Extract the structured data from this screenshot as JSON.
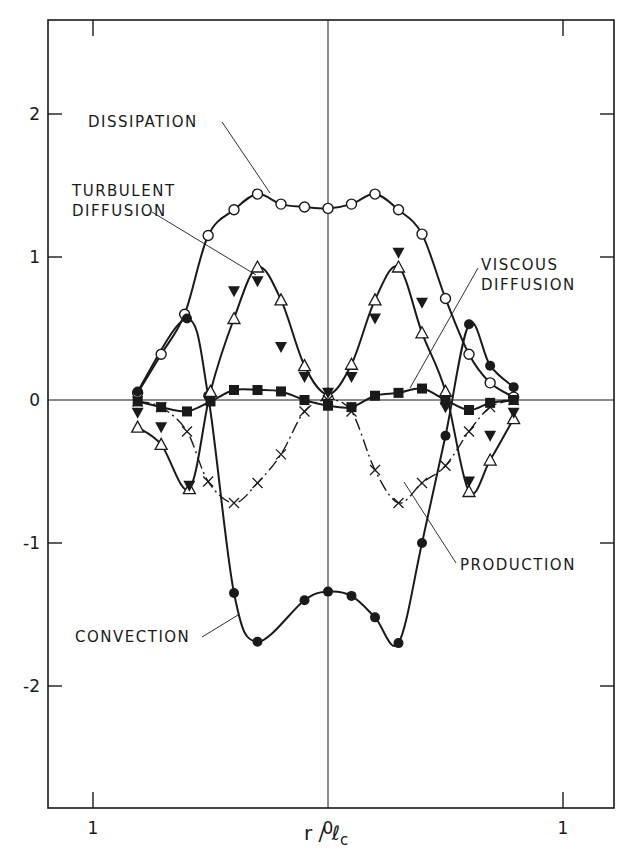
{
  "chart_data": {
    "type": "line",
    "title": "",
    "xlabel": "r / l_c",
    "xlabel_main": "r / ℓ",
    "xlabel_sub": "c",
    "ylabel": "",
    "xlim": [
      -1.19,
      1.22
    ],
    "ylim": [
      -2.71,
      2.66
    ],
    "x_ticks": [
      -1,
      0,
      1
    ],
    "x_tick_labels": [
      "1",
      "0",
      "1"
    ],
    "y_ticks": [
      2,
      1,
      0,
      -1,
      -2
    ],
    "y_tick_labels": [
      "2",
      "1",
      "0",
      "-1",
      "-2"
    ],
    "grid": false,
    "legend": "none (curves labeled directly with leader lines)",
    "annotations": [
      "DISSIPATION",
      "TURBULENT DIFFUSION",
      "VISCOUS DIFFUSION",
      "PRODUCTION",
      "CONVECTION"
    ],
    "series": [
      {
        "name": "Dissipation",
        "marker": "open-circle",
        "line": "solid",
        "x": [
          -0.81,
          -0.71,
          -0.61,
          -0.51,
          -0.4,
          -0.3,
          -0.2,
          -0.1,
          0.0,
          0.1,
          0.2,
          0.3,
          0.4,
          0.5,
          0.6,
          0.69,
          0.79
        ],
        "y": [
          0.05,
          0.32,
          0.6,
          1.15,
          1.33,
          1.44,
          1.37,
          1.35,
          1.34,
          1.37,
          1.44,
          1.33,
          1.16,
          0.71,
          0.32,
          0.12,
          0.02
        ]
      },
      {
        "name": "Convection",
        "marker": "filled-circle",
        "line": "solid",
        "x": [
          -0.81,
          -0.6,
          -0.51,
          -0.4,
          -0.3,
          -0.1,
          0.0,
          0.1,
          0.2,
          0.3,
          0.4,
          0.5,
          0.6,
          0.69,
          0.79
        ],
        "y": [
          0.06,
          0.57,
          0.03,
          -1.35,
          -1.69,
          -1.4,
          -1.34,
          -1.37,
          -1.52,
          -1.7,
          -1.0,
          -0.25,
          0.53,
          0.24,
          0.09
        ]
      },
      {
        "name": "Turbulent diffusion (open triangle)",
        "marker": "open-triangle",
        "line": "solid",
        "x": [
          -0.81,
          -0.71,
          -0.59,
          -0.5,
          -0.4,
          -0.3,
          -0.2,
          -0.1,
          0.0,
          0.1,
          0.2,
          0.3,
          0.4,
          0.5,
          0.6,
          0.69,
          0.79
        ],
        "y": [
          -0.19,
          -0.31,
          -0.62,
          0.06,
          0.57,
          0.93,
          0.7,
          0.24,
          0.04,
          0.25,
          0.7,
          0.93,
          0.47,
          0.06,
          -0.64,
          -0.42,
          -0.13
        ]
      },
      {
        "name": "Turbulent diffusion (filled triangle)",
        "marker": "filled-inverted-triangle",
        "line": "none",
        "x": [
          -0.81,
          -0.71,
          -0.59,
          -0.4,
          -0.3,
          -0.2,
          -0.1,
          0.0,
          0.1,
          0.2,
          0.3,
          0.4,
          0.5,
          0.6,
          0.69,
          0.79
        ],
        "y": [
          -0.09,
          -0.19,
          -0.6,
          0.76,
          0.83,
          0.37,
          0.16,
          0.05,
          0.16,
          0.57,
          1.03,
          0.68,
          -0.05,
          -0.57,
          -0.25,
          -0.09
        ]
      },
      {
        "name": "Viscous diffusion",
        "marker": "filled-square",
        "line": "solid",
        "x": [
          -0.81,
          -0.71,
          -0.6,
          -0.5,
          -0.4,
          -0.3,
          -0.2,
          -0.1,
          0.0,
          0.1,
          0.2,
          0.3,
          0.4,
          0.5,
          0.6,
          0.69,
          0.79
        ],
        "y": [
          -0.01,
          -0.05,
          -0.08,
          -0.01,
          0.07,
          0.07,
          0.06,
          0.0,
          -0.04,
          -0.05,
          0.03,
          0.05,
          0.08,
          0.0,
          -0.07,
          -0.02,
          0.0
        ]
      },
      {
        "name": "Production",
        "marker": "cross",
        "line": "dash-dot",
        "x": [
          -0.81,
          -0.71,
          -0.6,
          -0.51,
          -0.4,
          -0.3,
          -0.2,
          -0.1,
          0.0,
          0.1,
          0.2,
          0.3,
          0.4,
          0.5,
          0.6,
          0.69,
          0.79
        ],
        "y": [
          -0.01,
          -0.05,
          -0.22,
          -0.57,
          -0.72,
          -0.58,
          -0.38,
          -0.08,
          0.0,
          -0.08,
          -0.49,
          -0.72,
          -0.58,
          -0.46,
          -0.22,
          -0.05,
          0.0
        ]
      }
    ]
  },
  "labels": {
    "dissipation": "DISSIPATION",
    "turbulent_1": "TURBULENT",
    "turbulent_2": "DIFFUSION",
    "viscous_1": "VISCOUS",
    "viscous_2": "DIFFUSION",
    "production": "PRODUCTION",
    "convection": "CONVECTION"
  },
  "colors": {
    "ink": "#1a1a1a",
    "background": "#ffffff"
  }
}
